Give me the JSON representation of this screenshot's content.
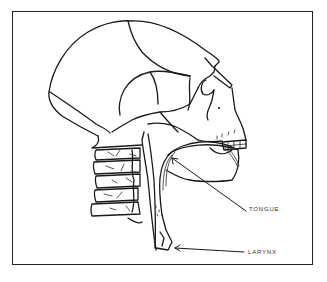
{
  "figure": {
    "type": "anatomical line drawing",
    "labels": [
      {
        "id": "tongue",
        "text": "TONGUE"
      },
      {
        "id": "larynx",
        "text": "LARYNX"
      }
    ],
    "colors": {
      "line": "#1a1a1a",
      "background": "#ffffff",
      "border": "#222222"
    }
  }
}
